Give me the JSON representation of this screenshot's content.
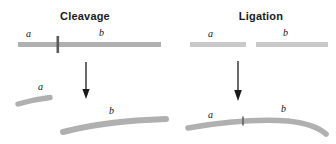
{
  "figure": {
    "width": 336,
    "height": 144,
    "background": "#ffffff",
    "strand_color": "#b0b0b0",
    "strand_color_light": "#c9c9c9",
    "tick_color": "#4a4a4a",
    "arrow_color": "#1a1a1a",
    "label_color": "#111111",
    "title_color": "#1a1a1a"
  },
  "panels": [
    {
      "id": "cleavage",
      "title": "Cleavage",
      "top_row": {
        "description": "single continuous strand with cleavage site tick",
        "labels": [
          {
            "text": "a",
            "x": 28,
            "y": 30
          },
          {
            "text": "b",
            "x": 101,
            "y": 29
          }
        ]
      },
      "arrow": {
        "x": 86,
        "y_start": 62,
        "y_end": 98
      },
      "bottom_row": {
        "description": "two separated product strands",
        "labels": [
          {
            "text": "a",
            "x": 40,
            "y": 84
          },
          {
            "text": "b",
            "x": 111,
            "y": 108
          }
        ]
      }
    },
    {
      "id": "ligation",
      "title": "Ligation",
      "top_row": {
        "description": "two separate strands with a gap",
        "labels": [
          {
            "text": "a",
            "x": 210,
            "y": 30
          },
          {
            "text": "b",
            "x": 285,
            "y": 29
          }
        ]
      },
      "arrow": {
        "x": 238,
        "y_start": 60,
        "y_end": 100
      },
      "bottom_row": {
        "description": "single joined strand with ligation junction tick",
        "labels": [
          {
            "text": "a",
            "x": 210,
            "y": 112
          },
          {
            "text": "b",
            "x": 283,
            "y": 106
          }
        ]
      }
    }
  ],
  "legend_letters": [
    "a",
    "b"
  ]
}
